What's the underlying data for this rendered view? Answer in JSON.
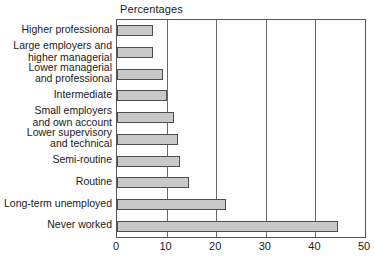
{
  "chart_data": {
    "type": "bar",
    "orientation": "horizontal",
    "title": "Percentages",
    "xlabel": "",
    "ylabel": "",
    "xlim": [
      0,
      50
    ],
    "ylim": null,
    "xticks": [
      0,
      10,
      20,
      30,
      40,
      50
    ],
    "xtick_labels": [
      "0",
      "10",
      "20",
      "30",
      "40",
      "50"
    ],
    "grid": "vertical",
    "legend": null,
    "bar_fill_color": "#c9c9c9",
    "bar_edge_color": "#4f4f4f",
    "axis_color": "#565656",
    "categories": [
      "Higher professional",
      "Large employers and\nhigher managerial",
      "Lower managerial\nand professional",
      "Intermediate",
      "Small employers\nand own account",
      "Lower supervisory\nand technical",
      "Semi-routine",
      "Routine",
      "Long-term unemployed",
      "Never worked"
    ],
    "values": [
      7.3,
      7.3,
      9.3,
      10.0,
      11.5,
      12.3,
      12.7,
      14.5,
      22.0,
      44.5
    ]
  }
}
